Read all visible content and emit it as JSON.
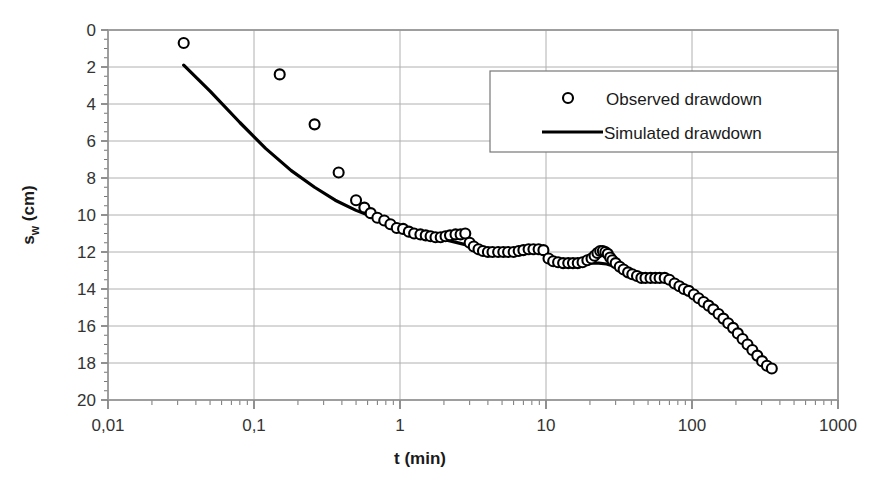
{
  "chart_data": {
    "type": "scatter",
    "title": "",
    "xlabel": "t (min)",
    "ylabel": "s_w (cm)",
    "ylabel_base": "s",
    "ylabel_subscript": "w",
    "ylabel_unit": " (cm)",
    "xscale": "log",
    "yscale": "linear",
    "y_inverted": true,
    "xlim": [
      0.01,
      1000
    ],
    "ylim": [
      0,
      20
    ],
    "grid": "horizontal-major-and-vertical-decades",
    "legend_position": "top-right-inside",
    "x_tick_labels": [
      "0,01",
      "0,1",
      "1",
      "10",
      "100",
      "1000"
    ],
    "x_tick_values": [
      0.01,
      0.1,
      1,
      10,
      100,
      1000
    ],
    "y_tick_labels": [
      "0",
      "2",
      "4",
      "6",
      "8",
      "10",
      "12",
      "14",
      "16",
      "18",
      "20"
    ],
    "y_tick_values": [
      0,
      2,
      4,
      6,
      8,
      10,
      12,
      14,
      16,
      18,
      20
    ],
    "series": [
      {
        "name": "Observed drawdown",
        "marker": "open-circle",
        "color": "#000000",
        "style": "markers",
        "points": [
          [
            0.033,
            0.7
          ],
          [
            0.15,
            2.4
          ],
          [
            0.26,
            5.1
          ],
          [
            0.38,
            7.7
          ],
          [
            0.5,
            9.2
          ],
          [
            0.57,
            9.6
          ],
          [
            0.63,
            9.9
          ],
          [
            0.7,
            10.15
          ],
          [
            0.78,
            10.3
          ],
          [
            0.86,
            10.5
          ],
          [
            0.95,
            10.7
          ],
          [
            1.05,
            10.75
          ],
          [
            1.15,
            10.9
          ],
          [
            1.25,
            11.0
          ],
          [
            1.38,
            11.05
          ],
          [
            1.5,
            11.1
          ],
          [
            1.62,
            11.15
          ],
          [
            1.75,
            11.2
          ],
          [
            1.9,
            11.2
          ],
          [
            2.05,
            11.15
          ],
          [
            2.2,
            11.1
          ],
          [
            2.4,
            11.05
          ],
          [
            2.6,
            11.05
          ],
          [
            2.8,
            11.0
          ],
          [
            3.0,
            11.5
          ],
          [
            3.2,
            11.7
          ],
          [
            3.45,
            11.85
          ],
          [
            3.7,
            11.95
          ],
          [
            4.0,
            12.0
          ],
          [
            4.3,
            12.0
          ],
          [
            4.7,
            12.0
          ],
          [
            5.1,
            12.0
          ],
          [
            5.5,
            12.0
          ],
          [
            6.0,
            12.0
          ],
          [
            6.5,
            11.95
          ],
          [
            7.0,
            11.9
          ],
          [
            7.6,
            11.85
          ],
          [
            8.2,
            11.85
          ],
          [
            8.9,
            11.85
          ],
          [
            9.6,
            11.9
          ],
          [
            10.4,
            12.35
          ],
          [
            11.2,
            12.5
          ],
          [
            12.1,
            12.55
          ],
          [
            13.1,
            12.6
          ],
          [
            14.2,
            12.6
          ],
          [
            15.3,
            12.6
          ],
          [
            16.5,
            12.6
          ],
          [
            17.8,
            12.55
          ],
          [
            19.2,
            12.45
          ],
          [
            20.5,
            12.35
          ],
          [
            21.5,
            12.2
          ],
          [
            22.5,
            12.05
          ],
          [
            23.5,
            11.95
          ],
          [
            24.5,
            11.95
          ],
          [
            25.5,
            12.0
          ],
          [
            26.5,
            12.1
          ],
          [
            27.5,
            12.3
          ],
          [
            28.5,
            12.45
          ],
          [
            30.0,
            12.6
          ],
          [
            32.0,
            12.8
          ],
          [
            34.0,
            12.95
          ],
          [
            36.5,
            13.1
          ],
          [
            39.0,
            13.2
          ],
          [
            42.0,
            13.3
          ],
          [
            45.0,
            13.4
          ],
          [
            48.0,
            13.4
          ],
          [
            52.0,
            13.4
          ],
          [
            56.0,
            13.4
          ],
          [
            60.0,
            13.4
          ],
          [
            65.0,
            13.4
          ],
          [
            70.0,
            13.5
          ],
          [
            76.0,
            13.7
          ],
          [
            82.0,
            13.85
          ],
          [
            88.0,
            14.0
          ],
          [
            95.0,
            14.1
          ],
          [
            103.0,
            14.3
          ],
          [
            111.0,
            14.5
          ],
          [
            120.0,
            14.7
          ],
          [
            130.0,
            14.9
          ],
          [
            140.0,
            15.1
          ],
          [
            152.0,
            15.35
          ],
          [
            164.0,
            15.6
          ],
          [
            177.0,
            15.85
          ],
          [
            191.0,
            16.1
          ],
          [
            206.0,
            16.4
          ],
          [
            222.0,
            16.7
          ],
          [
            240.0,
            17.0
          ],
          [
            259.0,
            17.3
          ],
          [
            280.0,
            17.6
          ],
          [
            302.0,
            17.9
          ],
          [
            326.0,
            18.15
          ],
          [
            352.0,
            18.3
          ]
        ]
      },
      {
        "name": "Simulated drawdown",
        "marker": "none",
        "color": "#000000",
        "style": "line",
        "points": [
          [
            0.033,
            1.9
          ],
          [
            0.05,
            3.3
          ],
          [
            0.08,
            5.0
          ],
          [
            0.12,
            6.4
          ],
          [
            0.18,
            7.6
          ],
          [
            0.26,
            8.5
          ],
          [
            0.36,
            9.2
          ],
          [
            0.5,
            9.75
          ],
          [
            0.7,
            10.2
          ],
          [
            0.95,
            10.6
          ],
          [
            1.3,
            10.95
          ],
          [
            1.7,
            11.2
          ],
          [
            2.2,
            11.4
          ],
          [
            2.8,
            11.6
          ],
          [
            3.5,
            11.8
          ],
          [
            4.4,
            11.95
          ],
          [
            5.5,
            12.0
          ],
          [
            7.0,
            12.0
          ],
          [
            8.5,
            11.95
          ],
          [
            10.0,
            12.2
          ],
          [
            12.0,
            12.45
          ],
          [
            14.0,
            12.55
          ],
          [
            16.0,
            12.6
          ],
          [
            18.0,
            12.6
          ],
          [
            20.0,
            12.6
          ],
          [
            23.0,
            12.6
          ],
          [
            26.0,
            12.65
          ],
          [
            30.0,
            12.8
          ],
          [
            35.0,
            13.0
          ],
          [
            40.0,
            13.2
          ],
          [
            46.0,
            13.3
          ],
          [
            53.0,
            13.4
          ],
          [
            62.0,
            13.45
          ],
          [
            72.0,
            13.6
          ],
          [
            84.0,
            13.8
          ],
          [
            98.0,
            14.1
          ],
          [
            115.0,
            14.4
          ],
          [
            135.0,
            14.8
          ],
          [
            158.0,
            15.3
          ],
          [
            185.0,
            15.8
          ],
          [
            216.0,
            16.4
          ],
          [
            253.0,
            17.0
          ],
          [
            296.0,
            17.7
          ],
          [
            352.0,
            18.45
          ]
        ]
      }
    ]
  },
  "legend": {
    "entries": [
      {
        "label": "Observed drawdown",
        "marker": "open-circle"
      },
      {
        "label": "Simulated drawdown",
        "marker": "line"
      }
    ]
  },
  "axes": {
    "x_title": "t (min)",
    "y_title_base": "s",
    "y_title_sub": "w",
    "y_title_unit": " (cm)"
  }
}
